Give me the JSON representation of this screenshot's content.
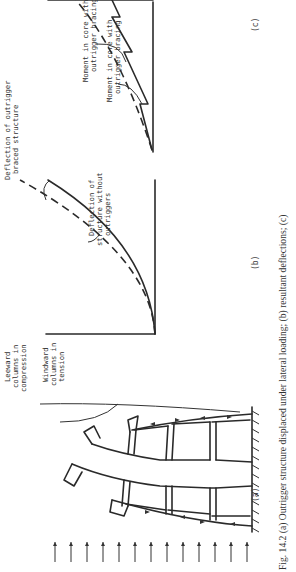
{
  "figure": {
    "caption": "Fig. 14.2  (a) Outrigger structure displaced under lateral loading; (b) resultant deflections; (c)",
    "panels": {
      "a": {
        "label": "(a)",
        "annotations": {
          "leeward_1": "Leeward",
          "leeward_2": "columns in",
          "leeward_3": "compression",
          "windward_1": "Windward",
          "windward_2": "columns in",
          "windward_3": "tension"
        },
        "load_arrow_count": 13
      },
      "b": {
        "label": "(b)",
        "annotations": {
          "braced_1": "Deflection of outrigger",
          "braced_2": "braced structure",
          "unbraced_1": "Deflection of",
          "unbraced_2": "structure without",
          "unbraced_3": "outriggers"
        }
      },
      "c": {
        "label": "(c)",
        "annotations": {
          "with_1": "Moment in core with",
          "with_2": "outrigger bracing",
          "without_1": "Moment in core without",
          "without_2": "outrigger bracing"
        }
      }
    },
    "colors": {
      "ink": "#2a2a2a",
      "paper": "#ffffff"
    }
  }
}
